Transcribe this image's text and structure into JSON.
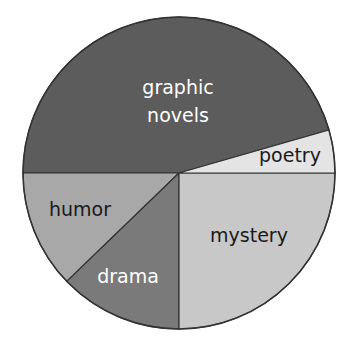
{
  "chart_data": {
    "type": "pie",
    "title": "",
    "center": [
      179,
      173
    ],
    "radius": 156,
    "slices": [
      {
        "label": "graphic novels",
        "lines": [
          "graphic",
          "novels"
        ],
        "start_deg": 16,
        "end_deg": 180,
        "value": 45.5,
        "color": "#5c5c5c",
        "text_color": "#ffffff",
        "label_pos": [
          178,
          94
        ],
        "line_gap": 28
      },
      {
        "label": "humor",
        "lines": [
          "humor"
        ],
        "start_deg": 180,
        "end_deg": 224,
        "value": 12.2,
        "color": "#a8a8a8",
        "text_color": "#1a1a1a",
        "label_pos": [
          80,
          216
        ]
      },
      {
        "label": "drama",
        "lines": [
          "drama"
        ],
        "start_deg": 224,
        "end_deg": 270,
        "value": 12.8,
        "color": "#7a7a7a",
        "text_color": "#ffffff",
        "label_pos": [
          128,
          283
        ]
      },
      {
        "label": "mystery",
        "lines": [
          "mystery"
        ],
        "start_deg": 270,
        "end_deg": 360,
        "value": 25.0,
        "color": "#c8c8c8",
        "text_color": "#1a1a1a",
        "label_pos": [
          249,
          242
        ]
      },
      {
        "label": "poetry",
        "lines": [
          "poetry"
        ],
        "start_deg": 0,
        "end_deg": 16,
        "value": 4.5,
        "color": "#e4e4e4",
        "text_color": "#1a1a1a",
        "label_pos": [
          290,
          162
        ]
      }
    ],
    "values_unit": "percent (estimated from angles)",
    "legend": "none (labels inside slices)"
  }
}
